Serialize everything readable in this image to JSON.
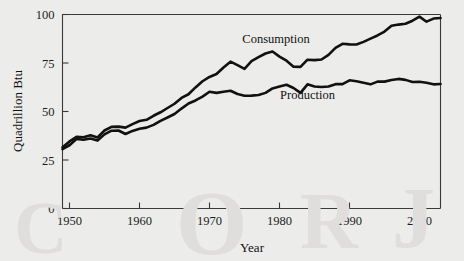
{
  "chart_data": {
    "type": "line",
    "title": "",
    "xlabel": "Year",
    "ylabel": "Quadrillion Btu",
    "xlim": [
      1949,
      2003
    ],
    "ylim": [
      0,
      100
    ],
    "xticks": [
      1950,
      1960,
      1970,
      1980,
      1990,
      2000
    ],
    "xtick_labels": [
      "1950",
      "1960",
      "1970",
      "1980",
      "1990",
      "2000"
    ],
    "yticks": [
      0,
      25,
      50,
      75,
      100
    ],
    "ytick_labels": [
      "0",
      "25",
      "50",
      "75",
      "100"
    ],
    "grid": false,
    "legend_position": "inline-annotation",
    "line_color": "#111111",
    "background_color": "#ececea",
    "x": [
      1949,
      1950,
      1951,
      1952,
      1953,
      1954,
      1955,
      1956,
      1957,
      1958,
      1959,
      1960,
      1961,
      1962,
      1963,
      1964,
      1965,
      1966,
      1967,
      1968,
      1969,
      1970,
      1971,
      1972,
      1973,
      1974,
      1975,
      1976,
      1977,
      1978,
      1979,
      1980,
      1981,
      1982,
      1983,
      1984,
      1985,
      1986,
      1987,
      1988,
      1989,
      1990,
      1991,
      1992,
      1993,
      1994,
      1995,
      1996,
      1997,
      1998,
      1999,
      2000,
      2001,
      2002,
      2003
    ],
    "series": [
      {
        "name": "Consumption",
        "label": "Consumption",
        "label_x": 1979.5,
        "label_y": 85.5,
        "values": [
          31.6,
          34.6,
          36.9,
          36.7,
          37.7,
          36.6,
          40.2,
          42.1,
          42.2,
          41.7,
          43.5,
          45.1,
          45.7,
          47.8,
          49.6,
          51.8,
          54.0,
          57.0,
          58.9,
          62.4,
          65.6,
          67.8,
          69.3,
          72.7,
          75.7,
          73.9,
          72.0,
          76.0,
          78.0,
          79.9,
          80.9,
          78.3,
          76.2,
          73.1,
          73.0,
          76.7,
          76.5,
          76.8,
          79.2,
          82.8,
          84.9,
          84.6,
          84.5,
          85.9,
          87.6,
          89.2,
          91.2,
          94.2,
          94.8,
          95.2,
          96.8,
          98.9,
          96.3,
          97.9,
          98.2
        ]
      },
      {
        "name": "Production",
        "label": "Production",
        "label_x": 1984.0,
        "label_y": 56.5,
        "values": [
          30.6,
          32.6,
          35.8,
          35.4,
          36.1,
          35.0,
          38.2,
          40.1,
          40.2,
          38.4,
          40.0,
          41.1,
          41.7,
          43.1,
          45.2,
          46.9,
          48.7,
          51.5,
          54.1,
          55.7,
          57.7,
          60.2,
          59.6,
          60.2,
          60.7,
          59.0,
          58.1,
          58.2,
          58.5,
          59.6,
          61.9,
          62.9,
          63.8,
          62.1,
          59.6,
          64.0,
          62.9,
          62.6,
          62.9,
          64.1,
          64.1,
          66.1,
          65.6,
          64.8,
          64.0,
          65.4,
          65.4,
          66.2,
          66.8,
          66.3,
          65.2,
          65.3,
          64.8,
          64.0,
          64.2
        ]
      }
    ]
  },
  "watermark": {
    "glyph_1": "C",
    "glyph_2": "O",
    "glyph_3": "R",
    "glyph_4": "J"
  }
}
